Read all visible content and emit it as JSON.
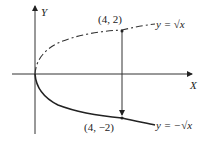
{
  "axes": {
    "x_label": "X",
    "y_label": "Y"
  },
  "points": [
    {
      "label": "(4, 2)",
      "x": 4,
      "y": 2
    },
    {
      "label": "(4, −2)",
      "x": 4,
      "y": -2
    }
  ],
  "curves": [
    {
      "label": "y = √x",
      "style": "dashed"
    },
    {
      "label": "y = −√x",
      "style": "solid"
    }
  ],
  "colors": {
    "ink": "#222222",
    "background": "#ffffff"
  }
}
